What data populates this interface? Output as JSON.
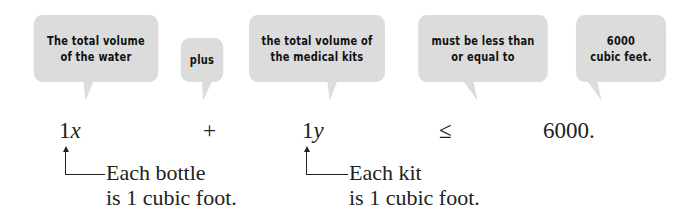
{
  "bubbles": [
    {
      "label": "The total volume of the water",
      "line1": "The total volume",
      "line2": "of the water"
    },
    {
      "label": "plus",
      "line1": "plus"
    },
    {
      "label": "the total volume of the medical kits",
      "line1": "the total volume of",
      "line2": "the medical kits"
    },
    {
      "label": "must be less than or equal to",
      "line1": "must be less than",
      "line2": "or equal to"
    },
    {
      "label": "6000 cubic feet.",
      "line1": "6000",
      "line2": "cubic feet."
    }
  ],
  "equation": {
    "term1_coef": "1",
    "term1_var": "x",
    "plus": "+",
    "term2_coef": "1",
    "term2_var": "y",
    "relation": "≤",
    "rhs": "6000."
  },
  "notes": [
    {
      "line1": "Each bottle",
      "line2": "is 1 cubic foot."
    },
    {
      "line1": "Each kit",
      "line2": "is 1 cubic foot."
    }
  ],
  "colors": {
    "bubble_fill": "#dcdcdc",
    "text": "#222222"
  }
}
